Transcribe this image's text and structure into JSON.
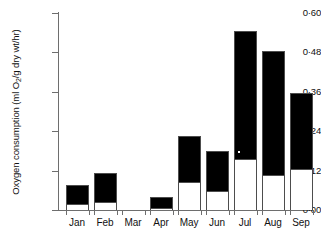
{
  "chart_data": {
    "type": "bar",
    "title": "",
    "xlabel": "",
    "ylabel": "Oxygen consumption (ml O2/g dry wt/hr)",
    "ylabel_parts": {
      "pre": "Oxygen consumption (ml O",
      "sub": "2",
      "post": "/g dry wt/hr)"
    },
    "categories": [
      "Jan",
      "Feb",
      "Mar",
      "Apr",
      "May",
      "Jun",
      "Jul",
      "Aug",
      "Sep"
    ],
    "ylim": [
      0.0,
      0.6
    ],
    "ytick_values": [
      0.0,
      0.12,
      0.24,
      0.36,
      0.48,
      0.6
    ],
    "ytick_labels": [
      "0·00",
      "0·12",
      "0·24",
      "0·36",
      "0·48",
      "0·60"
    ],
    "grid": false,
    "legend": "none",
    "stacked": true,
    "series": [
      {
        "name": "lower (white)",
        "color": "#ffffff",
        "values": [
          0.018,
          0.024,
          0.0,
          0.006,
          0.085,
          0.058,
          0.155,
          0.107,
          0.125
        ]
      },
      {
        "name": "upper (black)",
        "color": "#000000",
        "values": [
          0.058,
          0.089,
          0.0,
          0.034,
          0.14,
          0.122,
          0.39,
          0.378,
          0.23
        ]
      }
    ],
    "totals": [
      0.076,
      0.113,
      0.0,
      0.04,
      0.225,
      0.18,
      0.545,
      0.485,
      0.355
    ],
    "bars": [
      {
        "category": "Jan",
        "total": 0.076,
        "lower": 0.018,
        "x_center": 77
      },
      {
        "category": "Feb",
        "total": 0.113,
        "lower": 0.024,
        "x_center": 105
      },
      {
        "category": "Mar",
        "total": 0.0,
        "lower": 0.0,
        "x_center": 133
      },
      {
        "category": "Apr",
        "total": 0.04,
        "lower": 0.006,
        "x_center": 161
      },
      {
        "category": "May",
        "total": 0.225,
        "lower": 0.085,
        "x_center": 189
      },
      {
        "category": "Jun",
        "total": 0.18,
        "lower": 0.058,
        "x_center": 217
      },
      {
        "category": "Jul",
        "total": 0.545,
        "lower": 0.155,
        "x_center": 245
      },
      {
        "category": "Aug",
        "total": 0.485,
        "lower": 0.107,
        "x_center": 273
      },
      {
        "category": "Sep",
        "total": 0.355,
        "lower": 0.125,
        "x_center": 301
      }
    ]
  }
}
